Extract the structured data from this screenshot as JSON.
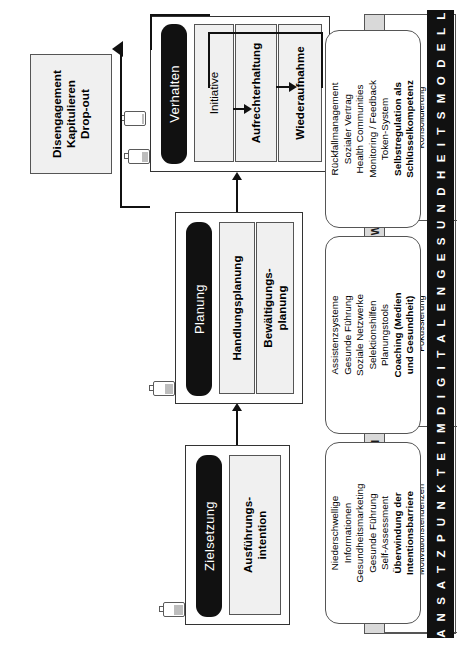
{
  "figure": {
    "title_band": "S E L B S T W I R K S A M K E I T S E R W A R T U N G E N",
    "banner": "A N S A T Z P U N K T E   I M   D I G I T A L E N   G E S U N D H E I T S M O D E L L"
  },
  "selfefficacy": {
    "cells": [
      {
        "l1": "Konkurrierende",
        "l2": "Motivationstendenzen",
        "l3": "Abwägendes Verhalten"
      },
      {
        "l1": "Konzeption und",
        "l2": "Fokussierung",
        "l3": "Intentionales Verhalten"
      },
      {
        "l1": "Umsetzung und",
        "l2": "Konsolidierung",
        "l3": "Aktives Verhalten"
      }
    ]
  },
  "stages": {
    "goal": {
      "pill": "Zielsetzung",
      "boxes": [
        {
          "l1": "Ausführungs-",
          "l2": "intention"
        }
      ]
    },
    "planning": {
      "pill": "Planung",
      "boxes": [
        {
          "l1": "Handlungsplanung",
          "l2": ""
        },
        {
          "l1": "Bewältigungs-",
          "l2": "planung"
        }
      ]
    },
    "behaviour": {
      "pill": "Verhalten",
      "boxes": [
        {
          "l1": "Initiative",
          "l2": ""
        },
        {
          "l1": "Aufrechterhaltung",
          "l2": ""
        },
        {
          "l1": "Wiederaufnahme",
          "l2": ""
        }
      ]
    },
    "dropout": {
      "l1": "Disengagement",
      "l2": "Kapitulieren",
      "l3": "Drop-out"
    }
  },
  "cards": [
    {
      "lines": [
        "Niederschwellige",
        "Informationen",
        "Gesundheitsmarketing",
        "Gesunde Führung",
        "Self-Assessment"
      ],
      "bold": [
        "Überwindung der",
        "Intentionsbarriere"
      ]
    },
    {
      "lines": [
        "Assistenzsysteme",
        "Gesunde Führung",
        "Soziale Netzwerke",
        "Selektionshilfen",
        "Planungstools"
      ],
      "bold": [
        "Coaching (Medien",
        "und Gesundheit)"
      ]
    },
    {
      "lines": [
        "Rückfallmanagement",
        "Sozialer Vertrag",
        "Health Communities",
        "Monitoring / Feedback",
        "Token-System"
      ],
      "bold": [
        "Selbstregulation als",
        "Schlüsselkompetenz"
      ]
    }
  ],
  "batteries": [
    {
      "name": "battery-goal",
      "level": "45%"
    },
    {
      "name": "battery-planning",
      "level": "40%"
    },
    {
      "name": "battery-behaviour",
      "level": "30%"
    },
    {
      "name": "battery-dropout",
      "level": "8%"
    }
  ],
  "colors": {
    "ink": "#111111",
    "band": "#d9d9d9",
    "box_fill": "#f0f0f0",
    "stroke": "#555555"
  }
}
